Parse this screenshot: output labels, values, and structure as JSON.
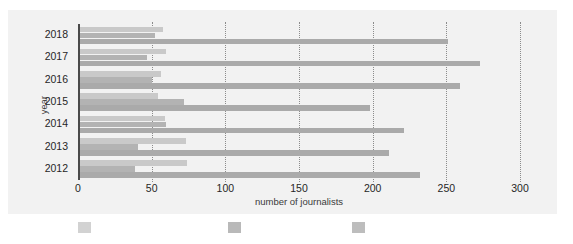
{
  "chart_data": {
    "type": "bar",
    "orientation": "horizontal",
    "title": "",
    "subtitle": "",
    "xlabel": "number of journalists",
    "ylabel": "year",
    "categories": [
      "2018",
      "2017",
      "2016",
      "2015",
      "2014",
      "2013",
      "2012"
    ],
    "xlim": [
      0,
      300
    ],
    "xticks": [
      0,
      50,
      100,
      150,
      200,
      250,
      300
    ],
    "xticklabels": [
      "0",
      "50",
      "100",
      "150",
      "200",
      "250",
      "300"
    ],
    "grid": "vertical-dotted",
    "legend_position": "bottom",
    "series": [
      {
        "name": "series-1",
        "color": "#c9c9c9",
        "values": [
          58,
          60,
          56,
          54,
          59,
          73,
          74
        ]
      },
      {
        "name": "series-2",
        "color": "#b3b3b3",
        "values": [
          52,
          47,
          50,
          72,
          60,
          41,
          39
        ]
      },
      {
        "name": "series-3",
        "color": "#aaaaaa",
        "values": [
          251,
          273,
          259,
          198,
          221,
          211,
          232
        ]
      }
    ]
  },
  "legend": {
    "items": [
      {
        "label": "",
        "color": "#d2d2d2"
      },
      {
        "label": "",
        "color": "#b9b9b9"
      },
      {
        "label": "",
        "color": "#bdbdbd"
      }
    ]
  },
  "colors": {
    "plot_background": "#f2f2f2",
    "page_background": "#ffffff",
    "axis": "#4a4a4a",
    "gridline": "#8c8c8c",
    "tick_text": "#262626",
    "axis_title_text": "#3a3a3a"
  }
}
